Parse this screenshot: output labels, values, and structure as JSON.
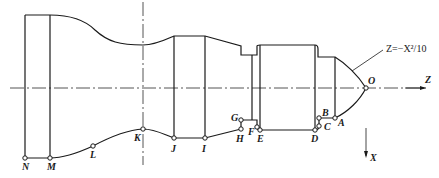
{
  "figure": {
    "type": "turning-part-profile",
    "equation_label": "Z=−X²/10",
    "axes": {
      "z_label": "Z",
      "x_label": "X"
    },
    "points": {
      "O": "O",
      "A": "A",
      "B": "B",
      "C": "C",
      "D": "D",
      "E": "E",
      "F": "F",
      "G": "G",
      "H": "H",
      "I": "I",
      "J": "J",
      "K": "K",
      "L": "L",
      "M": "M",
      "N": "N"
    }
  }
}
